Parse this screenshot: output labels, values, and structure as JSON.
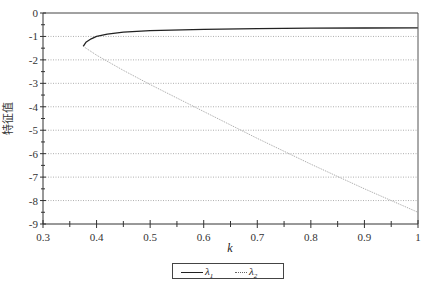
{
  "chart_data": {
    "type": "line",
    "title": "",
    "xlabel": "k",
    "ylabel": "特征值",
    "xlim": [
      0.3,
      1.0
    ],
    "ylim": [
      -9,
      0
    ],
    "xticks": [
      0.3,
      0.4,
      0.5,
      0.6,
      0.7,
      0.8,
      0.9,
      1.0
    ],
    "xtick_labels": [
      "0.3",
      "0.4",
      "0.5",
      "0.6",
      "0.7",
      "0.8",
      "0.9",
      "1"
    ],
    "yticks": [
      0,
      -1,
      -2,
      -3,
      -4,
      -5,
      -6,
      -7,
      -8,
      -9
    ],
    "ytick_labels": [
      "0",
      "-1",
      "-2",
      "-3",
      "-4",
      "-5",
      "-6",
      "-7",
      "-8",
      "-9"
    ],
    "grid": "horizontal dotted",
    "legend_position": "bottom-center",
    "series": [
      {
        "name": "λ1",
        "style": "solid",
        "color": "#222222",
        "x": [
          0.375,
          0.38,
          0.39,
          0.4,
          0.42,
          0.45,
          0.5,
          0.6,
          0.7,
          0.8,
          0.9,
          1.0
        ],
        "values": [
          -1.42,
          -1.25,
          -1.1,
          -1.0,
          -0.9,
          -0.82,
          -0.75,
          -0.7,
          -0.67,
          -0.65,
          -0.64,
          -0.63
        ]
      },
      {
        "name": "λ2",
        "style": "dotted",
        "color": "#999999",
        "x": [
          0.375,
          0.4,
          0.45,
          0.5,
          0.6,
          0.7,
          0.8,
          0.9,
          1.0
        ],
        "values": [
          -1.42,
          -1.8,
          -2.45,
          -3.05,
          -4.2,
          -5.35,
          -6.45,
          -7.5,
          -8.5
        ]
      }
    ]
  },
  "legend": {
    "items": [
      {
        "label": "λ",
        "sub": "1",
        "style": "solid"
      },
      {
        "label": "λ",
        "sub": "2",
        "style": "dotted"
      }
    ]
  }
}
